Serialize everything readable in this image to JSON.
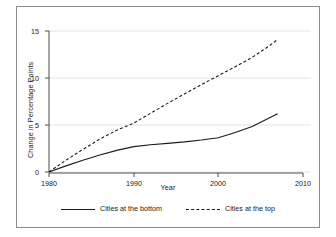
{
  "chart_data": {
    "type": "line",
    "title": "",
    "xlabel": "Year",
    "ylabel": "Change in Percentage Points",
    "xlim": [
      1980,
      2010
    ],
    "ylim": [
      0,
      15
    ],
    "xticks": [
      1980,
      1990,
      2000,
      2010
    ],
    "yticks": [
      0,
      5,
      10,
      15
    ],
    "grid": "horizontal",
    "legend_position": "bottom",
    "x": [
      1980,
      1982,
      1984,
      1986,
      1988,
      1990,
      1992,
      1994,
      1996,
      1998,
      2000,
      2002,
      2004,
      2006,
      2007
    ],
    "series": [
      {
        "name": "Cities at the bottom",
        "style": "solid",
        "color": "#1a1a1a",
        "values": [
          0.0,
          0.65,
          1.25,
          1.8,
          2.3,
          2.7,
          2.9,
          3.05,
          3.2,
          3.4,
          3.65,
          4.2,
          4.85,
          5.75,
          6.2
        ]
      },
      {
        "name": "Cities at the top",
        "style": "dashed",
        "color": "#1a1a1a",
        "values": [
          0.0,
          1.25,
          2.4,
          3.5,
          4.45,
          5.2,
          6.25,
          7.3,
          8.3,
          9.3,
          10.25,
          11.2,
          12.2,
          13.4,
          14.1
        ]
      }
    ]
  },
  "axes": {
    "y_label": "Change in Percentage Points",
    "x_label": "Year",
    "y_tick_labels": [
      "0",
      "5",
      "10",
      "15"
    ],
    "x_tick_labels": [
      "1980",
      "1990",
      "2000",
      "2010"
    ]
  },
  "legend": {
    "entries": [
      {
        "label": "Cities at the bottom",
        "style": "solid"
      },
      {
        "label": "Cities at the top",
        "style": "dashed"
      }
    ]
  },
  "colors": {
    "line": "#1a1a1a",
    "grid": "#e3e3e3",
    "axis": "#4d4d4d",
    "frame": "#8c8c8c",
    "background": "#ffffff"
  }
}
